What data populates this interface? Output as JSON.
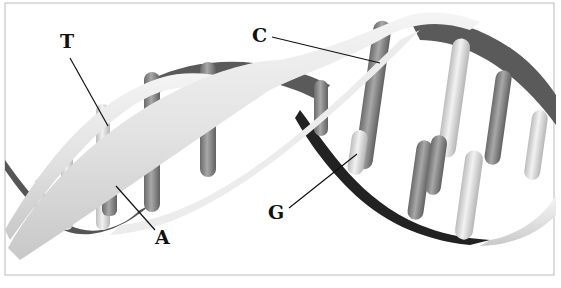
{
  "figure": {
    "labels": {
      "T": "T",
      "C": "C",
      "G": "G",
      "A": "A"
    },
    "colors": {
      "light_strand": "#e6e6e6",
      "dark_strand": "#555555",
      "light_base": "#dcdcdc",
      "dark_base": "#808080",
      "border": "#bbbbbb"
    }
  }
}
